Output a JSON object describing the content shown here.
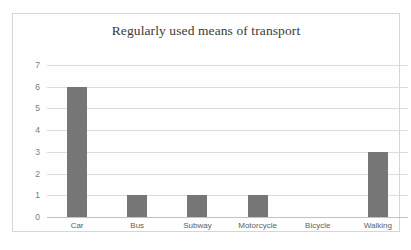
{
  "chart_data": {
    "type": "bar",
    "title": "Regularly used means of transport",
    "xlabel": "",
    "ylabel": "",
    "categories": [
      "Car",
      "Bus",
      "Subway",
      "Motorcycle",
      "Bicycle",
      "Walking"
    ],
    "values": [
      6,
      1,
      1,
      1,
      0,
      3
    ],
    "ylim": [
      0,
      7
    ],
    "yticks": [
      0,
      1,
      2,
      3,
      4,
      5,
      6,
      7
    ],
    "ytick_labels": [
      "0",
      "1",
      "2",
      "3",
      "4",
      "5",
      "6",
      "7"
    ],
    "grid": true,
    "legend": false,
    "bar_color": "#767676",
    "gridline_color": "#dcdcdc",
    "axis_color": "#c2c2c2",
    "title_color": "#3a3a3a",
    "tick_label_color": "#7b7b7b",
    "border_color": "#d6d6d6",
    "background": "#fefefe"
  }
}
